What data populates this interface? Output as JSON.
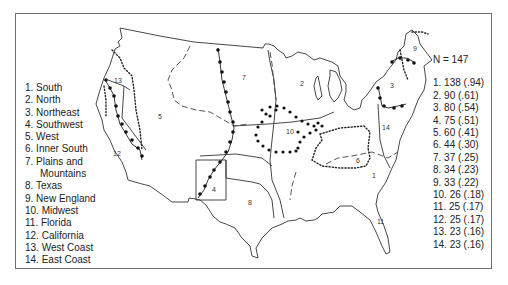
{
  "figure": {
    "sample_size_label": "N = 147",
    "regions": [
      {
        "num": "1",
        "name": "South",
        "count": "138",
        "proportion": ".94"
      },
      {
        "num": "2",
        "name": "North",
        "count": "90",
        "proportion": ".61"
      },
      {
        "num": "3",
        "name": "Northeast",
        "count": "80",
        "proportion": ".54"
      },
      {
        "num": "4",
        "name": "Southwest",
        "count": "75",
        "proportion": ".51"
      },
      {
        "num": "5",
        "name": "West",
        "count": "60",
        "proportion": ".41"
      },
      {
        "num": "6",
        "name": "Inner South",
        "count": "44",
        "proportion": ".30"
      },
      {
        "num": "7",
        "name": "Plains and Mountains",
        "count": "37",
        "proportion": ".25"
      },
      {
        "num": "8",
        "name": "Texas",
        "count": "34",
        "proportion": ".23"
      },
      {
        "num": "9",
        "name": "New England",
        "count": "33",
        "proportion": ".22"
      },
      {
        "num": "10",
        "name": "Midwest",
        "count": "26",
        "proportion": ".18"
      },
      {
        "num": "11",
        "name": "Florida",
        "count": "25",
        "proportion": ".17"
      },
      {
        "num": "12",
        "name": "California",
        "count": "25",
        "proportion": ".17"
      },
      {
        "num": "13",
        "name": "West Coast",
        "count": "23",
        "proportion": ".16"
      },
      {
        "num": "14",
        "name": "East Coast",
        "count": "23",
        "proportion": ".16"
      }
    ],
    "legend_left": [
      "1. South",
      "2. North",
      "3. Northeast",
      "4. Southwest",
      "5. West",
      "6. Inner South",
      "7. Plains and",
      "Mountains",
      "8. Texas",
      "9. New England",
      "10. Midwest",
      "11. Florida",
      "12. California",
      "13. West Coast",
      "14. East Coast"
    ],
    "legend_right": [
      "1. 138 (.94)",
      "2. 90 (.61)",
      "3. 80 (.54)",
      "4. 75 (.51)",
      "5. 60 (.41)",
      "6. 44 (.30)",
      "7. 37 (.25)",
      "8. 34 (.23)",
      "9. 33 (.22)",
      "10. 26 (.18)",
      "11. 25 (.17)",
      "12. 25 (.17)",
      "13. 23 (.16)",
      "14. 23 (.16)"
    ],
    "map_labels": {
      "r1": "1",
      "r2": "2",
      "r3": "3",
      "r4": "4",
      "r5": "5",
      "r6": "6",
      "r7": "7",
      "r8": "8",
      "r9": "9",
      "r10": "10",
      "r11": "11",
      "r12": "12",
      "r13": "13",
      "r14": "14"
    },
    "colors": {
      "line": "#333333",
      "frame": "#6f6f6f",
      "background": "#ffffff"
    }
  }
}
